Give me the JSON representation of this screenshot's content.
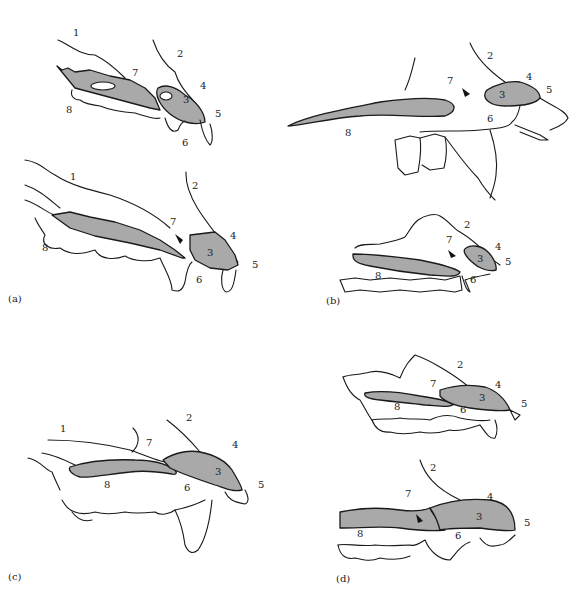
{
  "figure": {
    "panels": [
      {
        "id": "a",
        "label": "(a)",
        "drawings": [
          {
            "part_labels": [
              "1",
              "2",
              "3",
              "4",
              "5",
              "6",
              "7",
              "8"
            ]
          },
          {
            "part_labels": [
              "1",
              "2",
              "3",
              "4",
              "5",
              "6",
              "7",
              "8"
            ]
          }
        ]
      },
      {
        "id": "b",
        "label": "(b)",
        "drawings": [
          {
            "part_labels": [
              "2",
              "3",
              "4",
              "5",
              "6",
              "7",
              "8"
            ]
          },
          {
            "part_labels": [
              "2",
              "3",
              "4",
              "5",
              "6",
              "7",
              "8"
            ]
          }
        ]
      },
      {
        "id": "c",
        "label": "(c)",
        "drawings": [
          {
            "part_labels": [
              "1",
              "2",
              "3",
              "4",
              "5",
              "6",
              "7",
              "8"
            ]
          }
        ]
      },
      {
        "id": "d",
        "label": "(d)",
        "drawings": [
          {
            "part_labels": [
              "2",
              "3",
              "4",
              "5",
              "6",
              "7",
              "8"
            ]
          },
          {
            "part_labels": [
              "2",
              "3",
              "4",
              "5",
              "6",
              "7",
              "8"
            ]
          }
        ]
      }
    ],
    "colors": {
      "shaded_bone": "#a9a9a9",
      "outline": "#1a1a1a",
      "background": "#ffffff"
    }
  }
}
